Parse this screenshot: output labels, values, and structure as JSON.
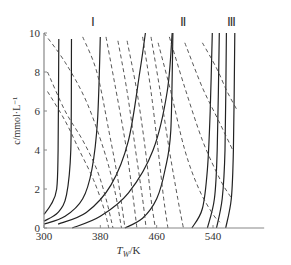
{
  "chart_data": {
    "type": "line",
    "title": "",
    "xlabel": "T_W/K",
    "ylabel": "c/mmol·L⁻¹",
    "xlim": [
      300,
      580
    ],
    "ylim": [
      0,
      10
    ],
    "xticks": [
      300,
      380,
      460,
      540
    ],
    "yticks": [
      0,
      2,
      4,
      6,
      8,
      10
    ],
    "grid": false,
    "legend": null,
    "region_labels": [
      {
        "label": "Ⅰ",
        "x": 370,
        "y": 10.6
      },
      {
        "label": "Ⅱ",
        "x": 497,
        "y": 10.6
      },
      {
        "label": "Ⅲ",
        "x": 566,
        "y": 10.6
      }
    ],
    "series": [
      {
        "name": "solid-1",
        "style": "solid",
        "points": [
          [
            300,
            0.7
          ],
          [
            310,
            1.2
          ],
          [
            318,
            2
          ],
          [
            320,
            4
          ],
          [
            321,
            9.7
          ]
        ]
      },
      {
        "name": "solid-2",
        "style": "solid",
        "points": [
          [
            300,
            0.35
          ],
          [
            320,
            0.8
          ],
          [
            332,
            1.7
          ],
          [
            338,
            4
          ],
          [
            339,
            9.7
          ]
        ]
      },
      {
        "name": "solid-3",
        "style": "solid",
        "points": [
          [
            300,
            0.2
          ],
          [
            330,
            0.6
          ],
          [
            355,
            1.5
          ],
          [
            368,
            3
          ],
          [
            376,
            5.5
          ],
          [
            380,
            9.8
          ]
        ]
      },
      {
        "name": "solid-4",
        "style": "solid",
        "points": [
          [
            320,
            0.2
          ],
          [
            360,
            0.8
          ],
          [
            395,
            2.2
          ],
          [
            420,
            4.5
          ],
          [
            436,
            8
          ],
          [
            444,
            10
          ]
        ]
      },
      {
        "name": "solid-5",
        "style": "solid",
        "points": [
          [
            340,
            0
          ],
          [
            380,
            0.6
          ],
          [
            420,
            1.8
          ],
          [
            455,
            4
          ],
          [
            475,
            7
          ],
          [
            482,
            10
          ]
        ]
      },
      {
        "name": "solid-6",
        "style": "solid",
        "points": [
          [
            415,
            0
          ],
          [
            440,
            0.5
          ],
          [
            460,
            1.5
          ],
          [
            472,
            3
          ],
          [
            480,
            5
          ],
          [
            483,
            10
          ]
        ]
      },
      {
        "name": "solid-7",
        "style": "solid",
        "points": [
          [
            510,
            0
          ],
          [
            525,
            1
          ],
          [
            532,
            3
          ],
          [
            536,
            6
          ],
          [
            539,
            10
          ]
        ]
      },
      {
        "name": "solid-8",
        "style": "solid",
        "points": [
          [
            532,
            0
          ],
          [
            542,
            1.5
          ],
          [
            546,
            4
          ],
          [
            549,
            10
          ]
        ]
      },
      {
        "name": "solid-9",
        "style": "solid",
        "points": [
          [
            545,
            0
          ],
          [
            553,
            1.5
          ],
          [
            557,
            4
          ],
          [
            559,
            10
          ]
        ]
      },
      {
        "name": "solid-10",
        "style": "solid",
        "points": [
          [
            558,
            0
          ],
          [
            566,
            1.5
          ],
          [
            569,
            4
          ],
          [
            571,
            10
          ]
        ]
      },
      {
        "name": "dashed-1",
        "style": "dashed",
        "points": [
          [
            300,
            10
          ],
          [
            330,
            8.5
          ],
          [
            360,
            6.5
          ],
          [
            385,
            4
          ],
          [
            400,
            2
          ],
          [
            410,
            0
          ]
        ]
      },
      {
        "name": "dashed-2",
        "style": "dashed",
        "points": [
          [
            305,
            8
          ],
          [
            330,
            6
          ],
          [
            355,
            4.5
          ],
          [
            375,
            3
          ],
          [
            388,
            1.5
          ],
          [
            398,
            0
          ]
        ]
      },
      {
        "name": "dashed-3",
        "style": "dashed",
        "points": [
          [
            305,
            7
          ],
          [
            330,
            5.5
          ],
          [
            350,
            4
          ],
          [
            370,
            2.5
          ],
          [
            385,
            1
          ],
          [
            392,
            0
          ]
        ]
      },
      {
        "name": "dashed-4",
        "style": "dashed",
        "points": [
          [
            355,
            9.8
          ],
          [
            375,
            8
          ],
          [
            392,
            5
          ],
          [
            405,
            2.5
          ],
          [
            415,
            0
          ]
        ]
      },
      {
        "name": "dashed-5",
        "style": "dashed",
        "points": [
          [
            388,
            9.8
          ],
          [
            400,
            7.5
          ],
          [
            415,
            4.5
          ],
          [
            425,
            2
          ],
          [
            432,
            0
          ]
        ]
      },
      {
        "name": "dashed-6",
        "style": "dashed",
        "points": [
          [
            405,
            9.6
          ],
          [
            418,
            7
          ],
          [
            430,
            4
          ],
          [
            440,
            1.5
          ],
          [
            445,
            0
          ]
        ]
      },
      {
        "name": "dashed-7",
        "style": "dashed",
        "points": [
          [
            418,
            9.6
          ],
          [
            432,
            7
          ],
          [
            444,
            4
          ],
          [
            452,
            1.5
          ],
          [
            458,
            0
          ]
        ]
      },
      {
        "name": "dashed-8",
        "style": "dashed",
        "points": [
          [
            440,
            9.8
          ],
          [
            452,
            7
          ],
          [
            462,
            4
          ],
          [
            470,
            1.5
          ],
          [
            476,
            0
          ]
        ]
      },
      {
        "name": "dashed-9",
        "style": "dashed",
        "points": [
          [
            452,
            9.8
          ],
          [
            465,
            7
          ],
          [
            478,
            4
          ],
          [
            490,
            1.5
          ],
          [
            498,
            0
          ]
        ]
      },
      {
        "name": "dashed-10",
        "style": "dashed",
        "points": [
          [
            462,
            9.5
          ],
          [
            480,
            7
          ],
          [
            500,
            4
          ],
          [
            520,
            2
          ],
          [
            540,
            0.7
          ],
          [
            550,
            0.3
          ]
        ]
      },
      {
        "name": "dashed-11",
        "style": "dashed",
        "points": [
          [
            478,
            9.8
          ],
          [
            500,
            7.2
          ],
          [
            525,
            4.5
          ],
          [
            550,
            2.5
          ],
          [
            565,
            1.6
          ]
        ]
      },
      {
        "name": "dashed-12",
        "style": "dashed",
        "points": [
          [
            500,
            9.5
          ],
          [
            525,
            7.2
          ],
          [
            548,
            5.5
          ],
          [
            568,
            4
          ]
        ]
      },
      {
        "name": "dashed-13",
        "style": "dashed",
        "points": [
          [
            525,
            9.5
          ],
          [
            545,
            8.2
          ],
          [
            560,
            7
          ],
          [
            575,
            6
          ]
        ]
      }
    ]
  }
}
